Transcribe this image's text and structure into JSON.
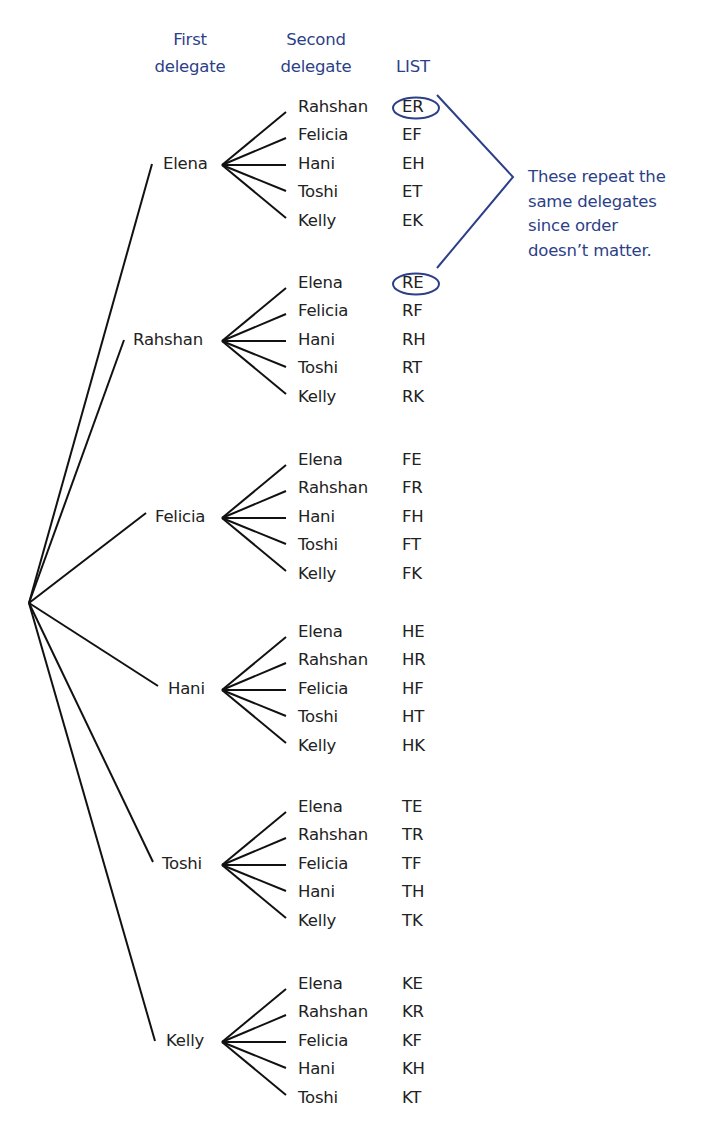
{
  "headers": {
    "first": [
      "First",
      "delegate"
    ],
    "second": [
      "Second",
      "delegate"
    ],
    "list": "LIST"
  },
  "colors": {
    "accent": "#2c3f88",
    "text": "#222222",
    "lines": "#111111"
  },
  "groups": [
    {
      "first": "Elena",
      "seconds": [
        "Rahshan",
        "Felicia",
        "Hani",
        "Toshi",
        "Kelly"
      ],
      "list": [
        "ER",
        "EF",
        "EH",
        "ET",
        "EK"
      ]
    },
    {
      "first": "Rahshan",
      "seconds": [
        "Elena",
        "Felicia",
        "Hani",
        "Toshi",
        "Kelly"
      ],
      "list": [
        "RE",
        "RF",
        "RH",
        "RT",
        "RK"
      ]
    },
    {
      "first": "Felicia",
      "seconds": [
        "Elena",
        "Rahshan",
        "Hani",
        "Toshi",
        "Kelly"
      ],
      "list": [
        "FE",
        "FR",
        "FH",
        "FT",
        "FK"
      ]
    },
    {
      "first": "Hani",
      "seconds": [
        "Elena",
        "Rahshan",
        "Felicia",
        "Toshi",
        "Kelly"
      ],
      "list": [
        "HE",
        "HR",
        "HF",
        "HT",
        "HK"
      ]
    },
    {
      "first": "Toshi",
      "seconds": [
        "Elena",
        "Rahshan",
        "Felicia",
        "Hani",
        "Kelly"
      ],
      "list": [
        "TE",
        "TR",
        "TF",
        "TH",
        "TK"
      ]
    },
    {
      "first": "Kelly",
      "seconds": [
        "Elena",
        "Rahshan",
        "Felicia",
        "Hani",
        "Toshi"
      ],
      "list": [
        "KE",
        "KR",
        "KF",
        "KH",
        "KT"
      ]
    }
  ],
  "annotation": {
    "circled": [
      "ER",
      "RE"
    ],
    "lines": [
      "These repeat the",
      "same delegates",
      "since order",
      "doesn’t matter."
    ]
  }
}
